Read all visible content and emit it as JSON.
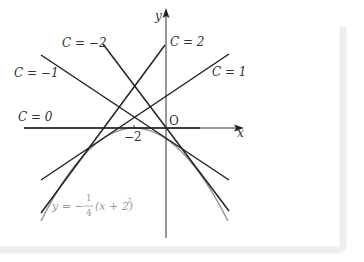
{
  "diagram": {
    "axes": {
      "x_label": "x",
      "y_label": "y",
      "origin_label": "O",
      "tick_label": "−2"
    },
    "lines": [
      {
        "label": "C = −2",
        "C": -2
      },
      {
        "label": "C = −1",
        "C": -1
      },
      {
        "label": "C = 0",
        "C": 0
      },
      {
        "label": "C = 1",
        "C": 1
      },
      {
        "label": "C = 2",
        "C": 2
      }
    ],
    "curve": {
      "label_lhs": "y = −",
      "label_num": "1",
      "label_den": "4",
      "label_rhs": "(x + 2)",
      "label_exp": "2",
      "equation": "y = -1/4 (x + 2)^2"
    },
    "colors": {
      "line": "#222222",
      "curve": "#999999",
      "frame": "#eeeeee"
    }
  }
}
